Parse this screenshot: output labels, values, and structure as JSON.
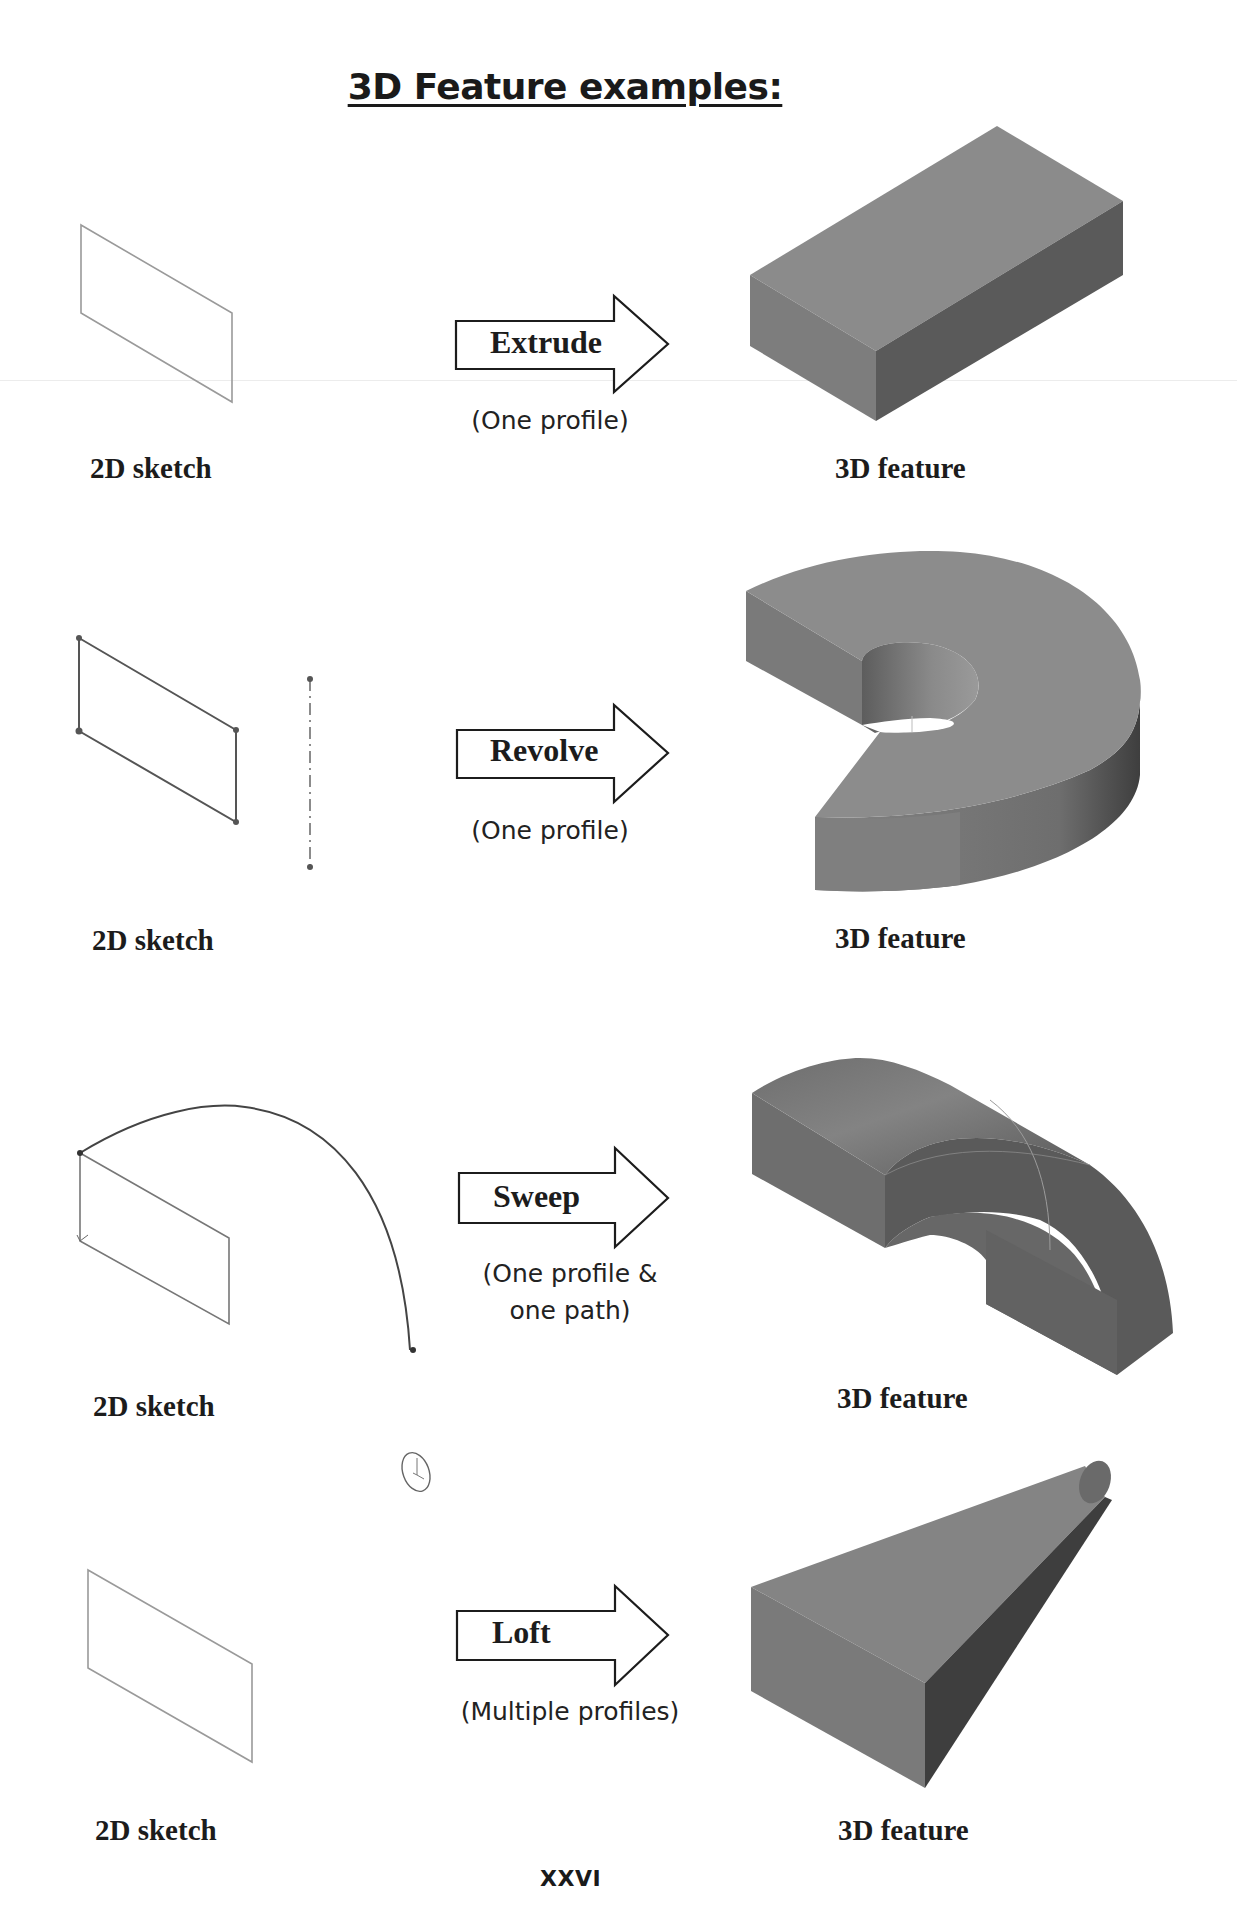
{
  "page": {
    "title": "3D Feature examples:",
    "page_number": "XXVI",
    "colors": {
      "solid_top": "#8a8a8a",
      "solid_front": "#7c7c7c",
      "solid_side": "#555555",
      "sketch_line": "#9a9a9a",
      "text": "#1c1c1c"
    }
  },
  "rows": [
    {
      "operation": "Extrude",
      "note_lines": [
        "(One profile)"
      ],
      "left_label": "2D sketch",
      "right_label": "3D feature",
      "shape": "rectangular-block"
    },
    {
      "operation": "Revolve",
      "note_lines": [
        "(One profile)"
      ],
      "left_label": "2D sketch",
      "right_label": "3D feature",
      "shape": "partial-revolved-ring"
    },
    {
      "operation": "Sweep",
      "note_lines": [
        "(One profile &",
        "one path)"
      ],
      "left_label": "2D sketch",
      "right_label": "3D feature",
      "shape": "swept-arc-solid"
    },
    {
      "operation": "Loft",
      "note_lines": [
        "(Multiple profiles)"
      ],
      "left_label": "2D sketch",
      "right_label": "3D feature",
      "shape": "lofted-rectangle-to-circle"
    }
  ]
}
